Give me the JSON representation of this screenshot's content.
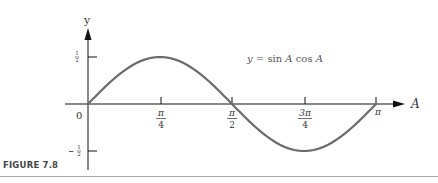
{
  "figure": {
    "caption": "FIGURE 7.8",
    "equation": "y = sin A cos A",
    "y_axis_label": "y",
    "x_axis_label": "A",
    "origin_label": "0"
  },
  "colors": {
    "curve": "#6b6b6b",
    "axis": "#111111",
    "text": "#333333"
  },
  "chart_data": {
    "type": "line",
    "title": "",
    "equation": "y = sin A cos A",
    "xlabel": "A",
    "ylabel": "y",
    "xlim": [
      0,
      3.14159
    ],
    "ylim": [
      -0.5,
      0.5
    ],
    "x_ticks": [
      {
        "value": 0.7854,
        "label_num": "π",
        "label_den": "4"
      },
      {
        "value": 1.5708,
        "label_num": "π",
        "label_den": "2"
      },
      {
        "value": 2.3562,
        "label_num": "3π",
        "label_den": "4"
      },
      {
        "value": 3.1416,
        "label": "π"
      }
    ],
    "y_ticks": [
      {
        "value": 0.5,
        "label": "½"
      },
      {
        "value": -0.5,
        "label": "−½"
      }
    ],
    "series": [
      {
        "name": "y = sin A cos A",
        "x": [
          0,
          0.3927,
          0.7854,
          1.1781,
          1.5708,
          1.9635,
          2.3562,
          2.7489,
          3.1416
        ],
        "values": [
          0,
          0.354,
          0.5,
          0.354,
          0,
          -0.354,
          -0.5,
          -0.354,
          0
        ]
      }
    ],
    "grid": false,
    "legend": "none"
  }
}
